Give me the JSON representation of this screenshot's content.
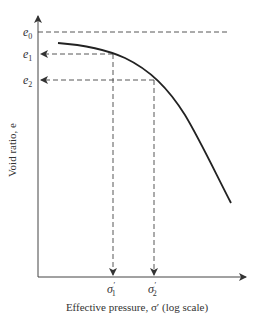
{
  "diagram": {
    "type": "e-log-sigma consolidation curve",
    "y_axis_label": "Void ratio, e",
    "x_axis_label": "Effective pressure, σ′ (log scale)",
    "y_ticks": {
      "e0": {
        "base": "e",
        "sub": "0"
      },
      "e1": {
        "base": "e",
        "sub": "1"
      },
      "e2": {
        "base": "e",
        "sub": "2"
      }
    },
    "x_ticks": {
      "s1": {
        "base": "σ",
        "prime": "′",
        "sub": "1"
      },
      "s2": {
        "base": "σ",
        "prime": "′",
        "sub": "2"
      }
    },
    "colors": {
      "line": "#222222",
      "dashed": "#444444",
      "text": "#333333"
    }
  }
}
